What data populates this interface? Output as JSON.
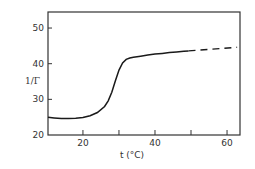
{
  "chart_data": {
    "type": "line",
    "title": "",
    "xlabel": "t (°C)",
    "ylabel": "1/Γ",
    "xlim": [
      10.3,
      63.6
    ],
    "ylim": [
      20,
      54.5
    ],
    "xticks": [
      20,
      30,
      40,
      50,
      60
    ],
    "xtick_labels": [
      "20",
      "",
      "40",
      "",
      "60"
    ],
    "yticks": [
      20,
      30,
      40,
      50
    ],
    "ytick_labels": [
      "20",
      "30",
      "40",
      "50"
    ],
    "grid": false,
    "legend": null,
    "series": [
      {
        "name": "measured",
        "style": "solid",
        "x": [
          10.3,
          12,
          14,
          16,
          18,
          20,
          22,
          24,
          26,
          27,
          28,
          29,
          30,
          31,
          32,
          33,
          34,
          36,
          38,
          40,
          42,
          44,
          46,
          48,
          49.3
        ],
        "y": [
          25.0,
          24.8,
          24.6,
          24.6,
          24.7,
          24.9,
          25.4,
          26.3,
          28.0,
          29.6,
          32.0,
          35.2,
          38.2,
          40.2,
          41.2,
          41.6,
          41.8,
          42.1,
          42.4,
          42.7,
          42.9,
          43.1,
          43.3,
          43.5,
          43.6
        ]
      },
      {
        "name": "extrapolated",
        "style": "dashed",
        "x": [
          49.3,
          62.8
        ],
        "y": [
          43.6,
          44.6
        ]
      }
    ]
  },
  "colors": {
    "line": "#1a1a1a",
    "axis": "#333333",
    "background": "#ffffff"
  }
}
